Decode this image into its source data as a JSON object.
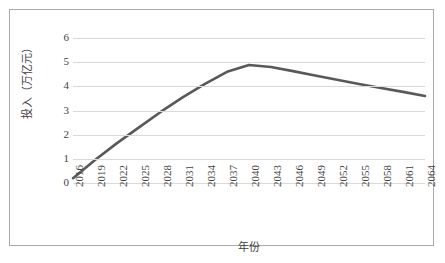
{
  "chart_data": {
    "type": "line",
    "title": "",
    "xlabel": "年份",
    "ylabel": "投入（万亿元）",
    "categories": [
      "2016",
      "2019",
      "2022",
      "2025",
      "2028",
      "2031",
      "2034",
      "2037",
      "2040",
      "2043",
      "2046",
      "2049",
      "2052",
      "2055",
      "2058",
      "2061",
      "2064"
    ],
    "x": [
      2016,
      2019,
      2022,
      2025,
      2028,
      2031,
      2034,
      2037,
      2040,
      2043,
      2046,
      2049,
      2052,
      2055,
      2058,
      2061,
      2064
    ],
    "values": [
      0.2,
      0.95,
      1.65,
      2.3,
      2.95,
      3.55,
      4.1,
      4.6,
      4.88,
      4.8,
      4.63,
      4.45,
      4.27,
      4.1,
      3.93,
      3.77,
      3.6
    ],
    "series": [
      {
        "name": "投入",
        "color": "#595959",
        "values": [
          0.2,
          0.95,
          1.65,
          2.3,
          2.95,
          3.55,
          4.1,
          4.6,
          4.88,
          4.8,
          4.63,
          4.45,
          4.27,
          4.1,
          3.93,
          3.77,
          3.6
        ]
      }
    ],
    "peak": {
      "x": 2041.5,
      "y": 4.9
    },
    "yticks": [
      "0",
      "1",
      "2",
      "3",
      "4",
      "5",
      "6"
    ],
    "ytick_values": [
      0,
      1,
      2,
      3,
      4,
      5,
      6
    ],
    "ylim": [
      0,
      6
    ],
    "xlim": [
      2016,
      2064
    ],
    "grid": "horizontal",
    "legend": "none",
    "line_color": "#595959",
    "grid_color": "#d9d9d9",
    "border_color": "#aaaaaa",
    "text_color": "#3f3f3f"
  }
}
